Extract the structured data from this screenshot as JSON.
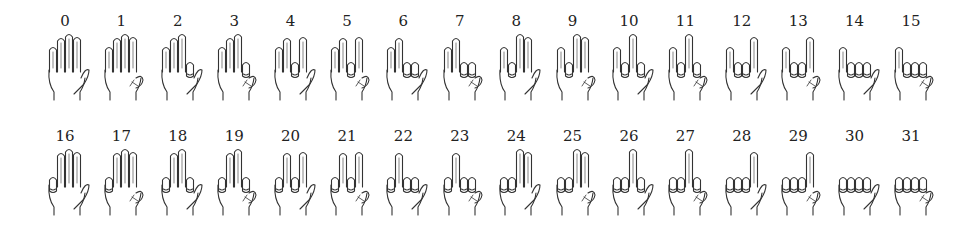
{
  "encoding": {
    "description": "Folded finger = bit set",
    "bits": [
      {
        "finger": "thumb",
        "value": 1
      },
      {
        "finger": "index",
        "value": 2
      },
      {
        "finger": "middle",
        "value": 4
      },
      {
        "finger": "ring",
        "value": 8
      },
      {
        "finger": "pinky",
        "value": 16
      }
    ]
  },
  "layout": {
    "rows": 2,
    "per_row": 16,
    "row_tops": [
      12,
      127
    ],
    "col_start": 37,
    "col_step": 56.4
  },
  "colors": {
    "ink": "#333333",
    "text": "#222222",
    "background": "#ffffff"
  },
  "items": [
    {
      "label": "0"
    },
    {
      "label": "1"
    },
    {
      "label": "2"
    },
    {
      "label": "3"
    },
    {
      "label": "4"
    },
    {
      "label": "5"
    },
    {
      "label": "6"
    },
    {
      "label": "7"
    },
    {
      "label": "8"
    },
    {
      "label": "9"
    },
    {
      "label": "10"
    },
    {
      "label": "11"
    },
    {
      "label": "12"
    },
    {
      "label": "13"
    },
    {
      "label": "14"
    },
    {
      "label": "15"
    },
    {
      "label": "16"
    },
    {
      "label": "17"
    },
    {
      "label": "18"
    },
    {
      "label": "19"
    },
    {
      "label": "20"
    },
    {
      "label": "21"
    },
    {
      "label": "22"
    },
    {
      "label": "23"
    },
    {
      "label": "24"
    },
    {
      "label": "25"
    },
    {
      "label": "26"
    },
    {
      "label": "27"
    },
    {
      "label": "28"
    },
    {
      "label": "29"
    },
    {
      "label": "30"
    },
    {
      "label": "31"
    }
  ]
}
